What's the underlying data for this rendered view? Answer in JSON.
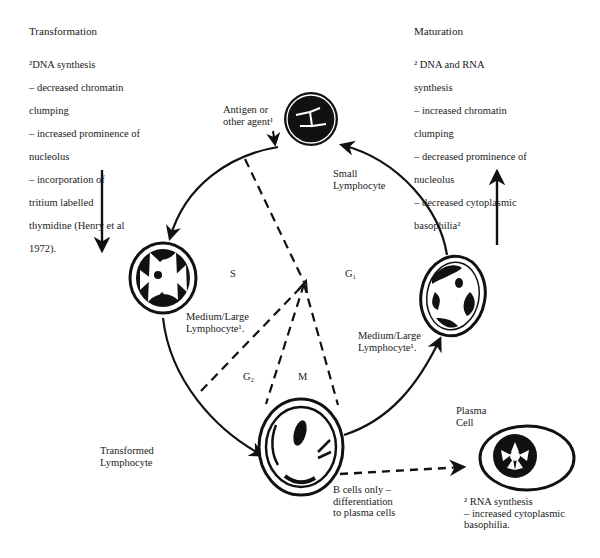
{
  "diagram": {
    "left_panel": {
      "heading": "Transformation",
      "lines": [
        "²DNA synthesis",
        "– decreased chromatin",
        "clumping",
        "– increased prominence of",
        "nucleolus",
        "– incorporation of",
        "tritium labelled",
        "thymidine (Henry et al",
        "1972)."
      ],
      "arrow_direction": "down"
    },
    "right_panel": {
      "heading": "Maturation",
      "lines": [
        "² DNA and RNA",
        "synthesis",
        "– increased chromatin",
        "clumping",
        "– decreased prominence of",
        "nucleolus",
        "– decreased cytoplasmic",
        "basophilia²"
      ],
      "arrow_direction": "up"
    },
    "labels": {
      "antigen": "Antigen or\nother agent¹",
      "small_lymphocyte": "Small\nLymphocyte",
      "medium_large_left": "Medium/Large\nLymphocyte¹.",
      "medium_large_right": "Medium/Large\nLymphocyte¹.",
      "transformed": "Transformed\nLymphocyte",
      "plasma_cell": "Plasma\nCell",
      "b_cells": "B cells only –\ndifferentiation\nto plasma cells",
      "plasma_notes": "² RNA synthesis\n– increased cytoplasmic\nbasophilia."
    },
    "phases": {
      "s": "S",
      "g1": "G₁",
      "g2": "G₂",
      "m": "M"
    },
    "nodes": [
      {
        "id": "small-lymphocyte",
        "label": "Small Lymphocyte",
        "position": "top"
      },
      {
        "id": "medium-large-left",
        "label": "Medium/Large Lymphocyte",
        "position": "left"
      },
      {
        "id": "transformed-lymphocyte",
        "label": "Transformed Lymphocyte",
        "position": "bottom"
      },
      {
        "id": "medium-large-right",
        "label": "Medium/Large Lymphocyte",
        "position": "right"
      },
      {
        "id": "plasma-cell",
        "label": "Plasma Cell",
        "position": "bottom-right"
      }
    ],
    "edges": [
      {
        "from": "small-lymphocyte",
        "to": "medium-large-left",
        "style": "solid"
      },
      {
        "from": "medium-large-left",
        "to": "transformed-lymphocyte",
        "style": "solid"
      },
      {
        "from": "transformed-lymphocyte",
        "to": "medium-large-right",
        "style": "solid"
      },
      {
        "from": "medium-large-right",
        "to": "small-lymphocyte",
        "style": "solid"
      },
      {
        "from": "transformed-lymphocyte",
        "to": "plasma-cell",
        "style": "dashed"
      }
    ],
    "colors": {
      "ink": "#111111",
      "background": "#ffffff"
    }
  }
}
